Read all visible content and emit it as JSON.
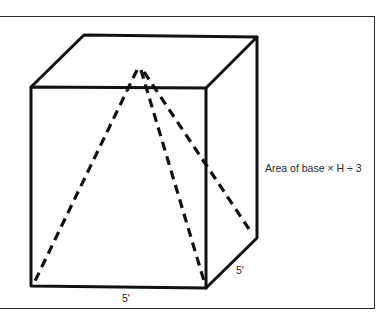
{
  "diagram": {
    "title": "",
    "shape": "cube with inscribed pyramid",
    "formula_label": "Area of base × H ÷ 3",
    "dimensions": {
      "front_width": "5'",
      "side_depth": "5'"
    },
    "colors": {
      "line": "#111111",
      "frame": "#2a2a2a",
      "background": "#ffffff"
    }
  }
}
